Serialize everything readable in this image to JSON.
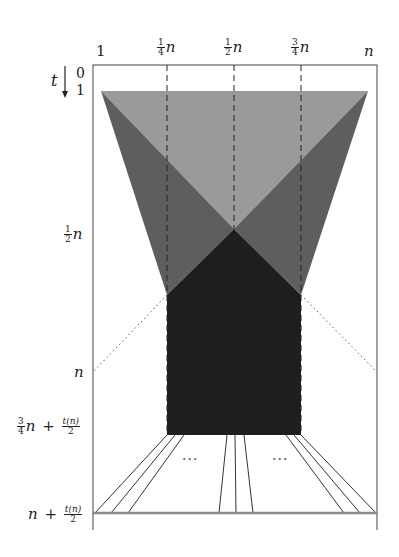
{
  "figure": {
    "type": "diagram",
    "colors": {
      "light_region": "#9a9a9a",
      "mid_region": "#5e5e5e",
      "dark_region": "#1e1e1e",
      "frame": "#444444",
      "bottom_line": "#8a8a8a",
      "lines": "#333333"
    },
    "x_axis": {
      "tick_labels": [
        {
          "id": "x1",
          "text": "1"
        },
        {
          "id": "xq",
          "num": "1",
          "den": "4",
          "var": "n"
        },
        {
          "id": "xh",
          "num": "1",
          "den": "2",
          "var": "n"
        },
        {
          "id": "x3q",
          "num": "3",
          "den": "4",
          "var": "n"
        },
        {
          "id": "xn",
          "text": "n"
        }
      ]
    },
    "y_axis": {
      "axis_label": "t",
      "arrow": "down-arrow",
      "tick_labels": [
        {
          "id": "t0",
          "text": "0"
        },
        {
          "id": "t1",
          "text": "1"
        },
        {
          "id": "thalf",
          "num": "1",
          "den": "2",
          "var": "n"
        },
        {
          "id": "tn",
          "text": "n"
        },
        {
          "id": "t34",
          "num": "3",
          "den": "4",
          "var": "n",
          "plus": "+",
          "num2": "t(n)",
          "den2": "2"
        },
        {
          "id": "tend",
          "var": "n",
          "plus": "+",
          "num2": "t(n)",
          "den2": "2"
        }
      ]
    },
    "annotations": {
      "ellipsis_left": "···",
      "ellipsis_right": "···"
    }
  }
}
